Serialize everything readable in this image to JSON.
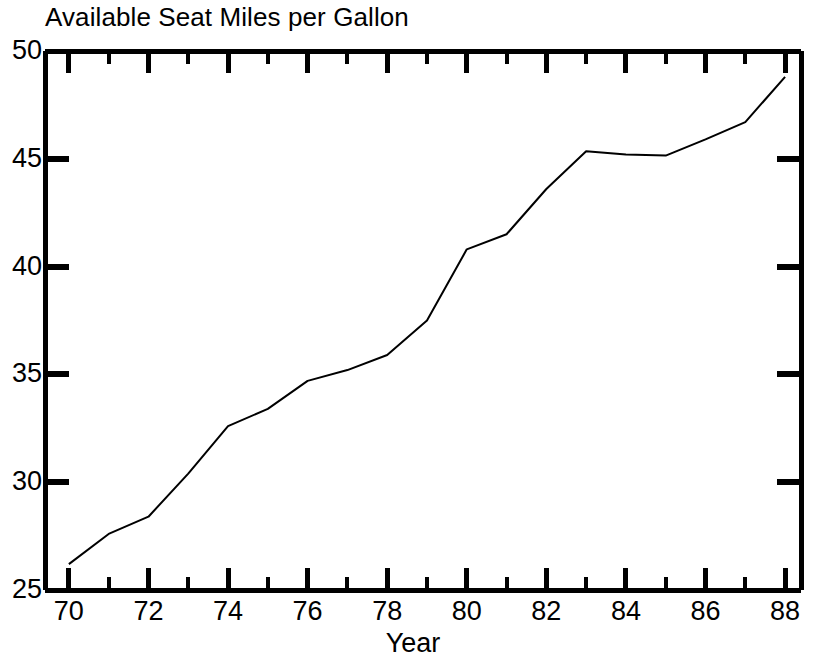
{
  "chart_data": {
    "type": "line",
    "title": "Available Seat Miles per Gallon",
    "xlabel": "Year",
    "ylabel": "",
    "xlim": [
      69.4,
      88.4
    ],
    "ylim": [
      25,
      50
    ],
    "grid": false,
    "legend": "none",
    "x_major_ticks": [
      70,
      72,
      74,
      76,
      78,
      80,
      82,
      84,
      86,
      88
    ],
    "x_minor_ticks": [
      71,
      73,
      75,
      77,
      79,
      81,
      83,
      85,
      87
    ],
    "x_tick_labels": [
      "70",
      "72",
      "74",
      "76",
      "78",
      "80",
      "82",
      "84",
      "86",
      "88"
    ],
    "y_major_ticks": [
      25,
      30,
      35,
      40,
      45,
      50
    ],
    "y_tick_labels": [
      "25",
      "30",
      "35",
      "40",
      "45",
      "50"
    ],
    "line_color": "#000000",
    "line_width": 2,
    "series": [
      {
        "name": "Available Seat Miles per Gallon",
        "x": [
          70,
          71,
          72,
          73,
          74,
          75,
          76,
          77,
          78,
          79,
          80,
          81,
          82,
          83,
          84,
          85,
          86,
          87,
          88
        ],
        "values": [
          26.2,
          27.6,
          28.4,
          30.4,
          32.6,
          33.4,
          34.7,
          35.2,
          35.9,
          37.5,
          40.8,
          41.5,
          43.6,
          45.35,
          45.2,
          45.15,
          45.9,
          46.7,
          48.8
        ]
      }
    ]
  },
  "axes": {
    "x_axis_title": "Year",
    "frame_color": "#000000"
  }
}
